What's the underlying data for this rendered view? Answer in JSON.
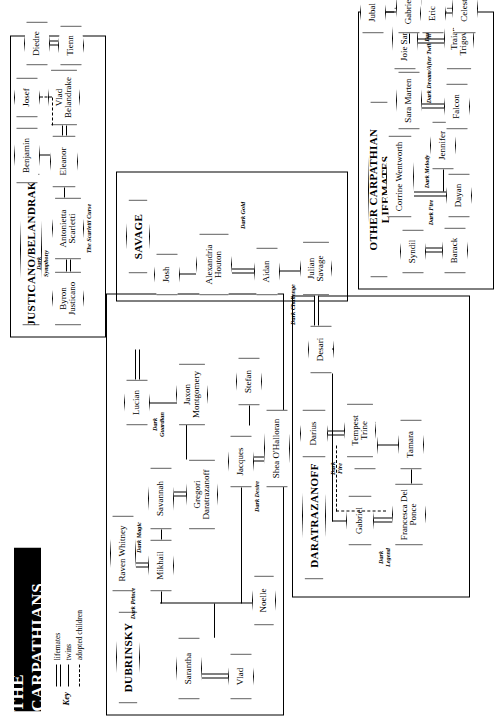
{
  "title": "THE CARPATHIANS",
  "key": {
    "label": "Key",
    "entries": [
      {
        "name": "lifemates",
        "style": "double-line"
      },
      {
        "name": "twins",
        "style": "single-line"
      },
      {
        "name": "adopted children",
        "style": "dashed-line"
      }
    ]
  },
  "groups": [
    {
      "id": "dubrinsky",
      "label": "DUBRINSKY"
    },
    {
      "id": "daratrazanoff",
      "label": "DARATRAZANOFF"
    },
    {
      "id": "savage",
      "label": "SAVAGE"
    },
    {
      "id": "lifemates",
      "label": "OTHER CARPATHIAN LIFEMATES"
    },
    {
      "id": "justicano",
      "label": "JUSTICANO/BELANDRAKE"
    }
  ],
  "people": {
    "vlad": "Vlad",
    "sarantha": "Sarantha",
    "noelle": "Noelle",
    "mikhail": "Mikhail",
    "raven": "Raven Whitney",
    "savannah": "Savannah",
    "gregori": "Gregori Daratrazanoff",
    "jacques": "Jacques",
    "shea": "Shea O'Halloran",
    "stefan": "Stefan",
    "lucian": "Lucian",
    "jaxon": "Jaxon Montgomery",
    "gabriel": "Gabriel",
    "francesca": "Francesca Del Ponce",
    "tamara": "Tamara",
    "skyler": "Skyler",
    "darius": "Darius",
    "tempest": "Tempest Trine",
    "desari": "Desari",
    "julian": "Julian Savage",
    "alexandria": "Alexandria Houton",
    "aidan": "Aidan",
    "josh": "Josh",
    "barack": "Barack",
    "syndil": "Syndil",
    "dayan": "Dayan",
    "corrine": "Corrine Wentworth",
    "jennifer": "Jennifer",
    "falcon": "Falcon",
    "sara": "Sara Marten",
    "traian": "Traian Trigovise",
    "joie": "Joie Sanders",
    "gabrielle": "Gabrielle",
    "jubal": "Jubal",
    "celeste": "Celeste",
    "eric": "Eric",
    "byron": "Byron Justicano",
    "antonietta": "Antonietta Scarletti",
    "eleanor": "Eleanor",
    "vladb": "Vlad Belandrake",
    "diedre": "Diedre",
    "tienn": "Tienn",
    "benjamin": "Benjamin",
    "josef": "Josef"
  },
  "book_titles": {
    "dark_prince": "Dark Prince",
    "dark_magic": "Dark Magic",
    "dark_desire": "Dark Desire",
    "dark_guardian": "Dark\nGuardian",
    "dark_legend": "Dark\nLegend",
    "dark_fire": "Dark\nFire",
    "dark_challenge": "Dark Challenge",
    "dark_gold": "Dark Gold",
    "dark_fire2": "Dark Fire",
    "dark_melody": "Dark Melody",
    "dark_dream_after_twilight": "Dark Dream/After Twilight",
    "dark_descent_the_only_one": "Dark Descent/The Only One",
    "dark_symphony": "Dark\nSymphony",
    "the_scarletti_curse": "The Scarletti Curse"
  }
}
